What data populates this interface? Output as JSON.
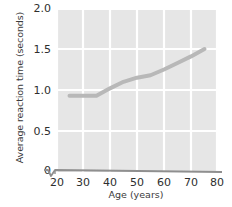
{
  "chart_data": {
    "type": "line",
    "title": "",
    "xlabel": "Age (years)",
    "ylabel": "Average reaction time (seconds)",
    "xlim": [
      20,
      80
    ],
    "ylim": [
      0,
      2.0
    ],
    "xticks": [
      20,
      30,
      40,
      50,
      60,
      70,
      80
    ],
    "yticks": [
      0,
      0.5,
      1.0,
      1.5,
      2.0
    ],
    "xticklabels": [
      "20",
      "30",
      "40",
      "50",
      "60",
      "70",
      "80"
    ],
    "yticklabels": [
      "0",
      "0.5",
      "1.0",
      "1.5",
      "2.0"
    ],
    "grid": true,
    "legend": false,
    "axis_break": true,
    "plot_background": "#e6e6e6",
    "gridline_color": "#ffffff",
    "line_color": "#b8b8b8",
    "axis_color": "#8c8c8c",
    "text_color": "#2e2e2e",
    "x": [
      25,
      30,
      35,
      40,
      45,
      50,
      55,
      60,
      65,
      70,
      75
    ],
    "values": [
      0.93,
      0.93,
      0.93,
      1.02,
      1.1,
      1.15,
      1.18,
      1.25,
      1.33,
      1.41,
      1.5
    ],
    "series": [
      {
        "name": "Average reaction time",
        "x": [
          25,
          30,
          35,
          40,
          45,
          50,
          55,
          60,
          65,
          70,
          75
        ],
        "values": [
          0.93,
          0.93,
          0.93,
          1.02,
          1.1,
          1.15,
          1.18,
          1.25,
          1.33,
          1.41,
          1.5
        ]
      }
    ]
  },
  "axes": {
    "y_title": "Average reaction time (seconds)",
    "x_title": "Age (years)",
    "y_labels": [
      {
        "text": "2.0",
        "value": 2.0
      },
      {
        "text": "1.5",
        "value": 1.5
      },
      {
        "text": "1.0",
        "value": 1.0
      },
      {
        "text": "0.5",
        "value": 0.5
      },
      {
        "text": "0",
        "value": 0
      }
    ],
    "x_labels": [
      {
        "text": "20",
        "value": 20
      },
      {
        "text": "30",
        "value": 30
      },
      {
        "text": "40",
        "value": 40
      },
      {
        "text": "50",
        "value": 50
      },
      {
        "text": "60",
        "value": 60
      },
      {
        "text": "70",
        "value": 70
      },
      {
        "text": "80",
        "value": 80
      }
    ]
  }
}
